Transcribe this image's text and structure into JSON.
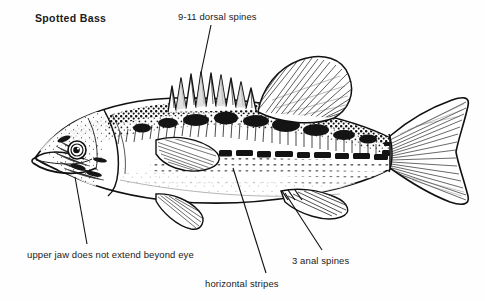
{
  "figure": {
    "title": "Spotted Bass",
    "style": "black-and-white-line-drawing",
    "background_color": "#ffffff",
    "ink_color": "#111111"
  },
  "annotations": {
    "dorsal_spines": {
      "text": "9-11 dorsal spines",
      "leader_from": [
        211,
        25
      ],
      "leader_to": [
        201,
        73
      ]
    },
    "upper_jaw": {
      "text": "upper jaw does not extend beyond eye",
      "leader_from": [
        87,
        244
      ],
      "leader_to": [
        75,
        177
      ]
    },
    "anal_spines": {
      "text": "3 anal spines",
      "leader_from": [
        322,
        250
      ],
      "leader_to": [
        285,
        193
      ]
    },
    "horizontal_stripes": {
      "text": "horizontal stripes",
      "leader_from": [
        266,
        273
      ],
      "leader_to": [
        233,
        168
      ]
    }
  },
  "fish_parts": [
    "head",
    "eye",
    "upper-jaw",
    "lower-jaw",
    "gill-cover",
    "spiny-dorsal-fin",
    "soft-dorsal-fin",
    "pectoral-fin",
    "pelvic-fin",
    "anal-fin",
    "caudal-fin",
    "lateral-stripe",
    "body-scales"
  ]
}
